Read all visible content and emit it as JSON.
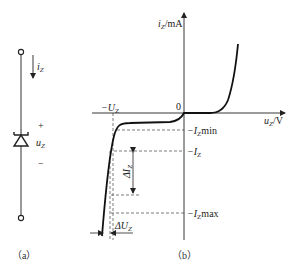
{
  "figure_a": {
    "caption": "（a）",
    "current_label": "i",
    "current_sub": "Z",
    "voltage_label": "u",
    "voltage_sub": "Z",
    "plus": "+",
    "minus": "−",
    "component": "zener-diode"
  },
  "figure_b": {
    "caption": "（b）",
    "y_axis_label": "i",
    "y_axis_sub": "Z",
    "y_axis_unit": "/mA",
    "x_axis_label": "u",
    "x_axis_sub": "Z",
    "x_axis_unit": "/V",
    "origin": "0",
    "uz_label": "−U",
    "uz_sub": "Z",
    "izmin_label": "−I",
    "izmin_sub": "Z",
    "izmin_suffix": "min",
    "iz_label": "−I",
    "iz_sub": "Z",
    "izmax_label": "−I",
    "izmax_sub": "Z",
    "izmax_suffix": "max",
    "delta_i_label": "ΔI",
    "delta_i_sub": "Z",
    "delta_u_label": "ΔU",
    "delta_u_sub": "Z"
  }
}
